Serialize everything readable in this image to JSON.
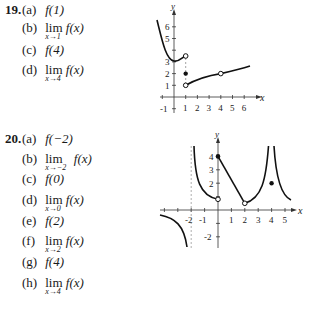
{
  "problems": [
    {
      "number": "19.",
      "parts": [
        {
          "label": "(a)",
          "kind": "value",
          "text": "f(1)"
        },
        {
          "label": "(b)",
          "kind": "limit",
          "lim": "lim",
          "sub": "x→1",
          "text": "f(x)"
        },
        {
          "label": "(c)",
          "kind": "value",
          "text": "f(4)"
        },
        {
          "label": "(d)",
          "kind": "limit",
          "lim": "lim",
          "sub": "x→4",
          "text": "f(x)"
        }
      ],
      "graph": {
        "x_axis_label": "x",
        "y_axis_label": "y",
        "x_ticks": [
          "1",
          "2",
          "3",
          "4",
          "5",
          "6"
        ],
        "y_ticks": [
          "-1",
          "1",
          "2",
          "3",
          "5",
          "6"
        ]
      }
    },
    {
      "number": "20.",
      "parts": [
        {
          "label": "(a)",
          "kind": "value",
          "text": "f(−2)"
        },
        {
          "label": "(b)",
          "kind": "limit",
          "lim": "lim",
          "sub": "x→−2",
          "text": "f(x)"
        },
        {
          "label": "(c)",
          "kind": "value",
          "text": "f(0)"
        },
        {
          "label": "(d)",
          "kind": "limit",
          "lim": "lim",
          "sub": "x→0",
          "text": "f(x)"
        },
        {
          "label": "(e)",
          "kind": "value",
          "text": "f(2)"
        },
        {
          "label": "(f)",
          "kind": "limit",
          "lim": "lim",
          "sub": "x→2",
          "text": "f(x)"
        },
        {
          "label": "(g)",
          "kind": "value",
          "text": "f(4)"
        },
        {
          "label": "(h)",
          "kind": "limit",
          "lim": "lim",
          "sub": "x→4",
          "text": "f(x)"
        }
      ],
      "graph": {
        "x_axis_label": "x",
        "y_axis_label": "y",
        "x_ticks": [
          "-2",
          "-1",
          "1",
          "2",
          "3",
          "4",
          "5"
        ],
        "y_ticks": [
          "-2",
          "2",
          "3",
          "4"
        ]
      }
    }
  ]
}
